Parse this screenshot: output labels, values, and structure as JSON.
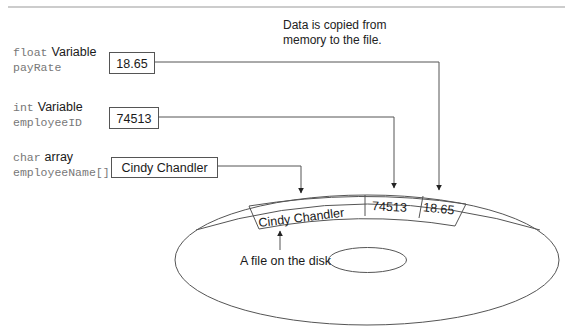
{
  "caption": {
    "line1": "Data is copied from",
    "line2": "memory to the file."
  },
  "variables": [
    {
      "type": "float",
      "kind": "Variable",
      "name": "payRate",
      "value": "18.65"
    },
    {
      "type": "int",
      "kind": "Variable",
      "name": "employeeID",
      "value": "74513"
    },
    {
      "type": "char",
      "kind": "array",
      "name": "employeeName[]",
      "value": "Cindy Chandler"
    }
  ],
  "file": {
    "fields": [
      "Cindy Chandler",
      "74513",
      "18.65"
    ],
    "label": "A file on the disk"
  },
  "colors": {
    "line": "#555555",
    "text": "#1a1a1a",
    "code": "#777777"
  }
}
